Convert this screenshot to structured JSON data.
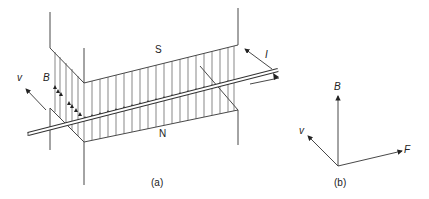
{
  "figure": {
    "part_a": {
      "caption": "(a)",
      "pole_top": "S",
      "pole_bottom": "N",
      "field_label": "B",
      "velocity_label": "v",
      "current_label": "I"
    },
    "part_b": {
      "caption": "(b)",
      "vectors": [
        {
          "name": "B",
          "direction": "up"
        },
        {
          "name": "v",
          "direction": "up-left"
        },
        {
          "name": "F",
          "direction": "right"
        }
      ]
    },
    "colors": {
      "line": "#333333",
      "background": "#ffffff"
    }
  }
}
